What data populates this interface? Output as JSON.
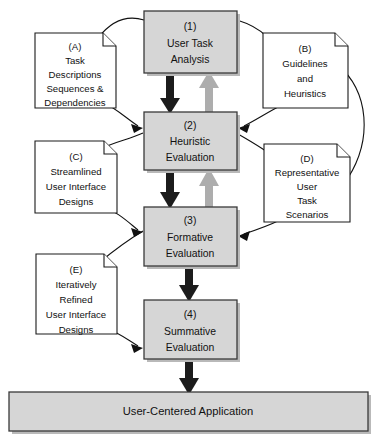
{
  "diagram": {
    "canvas": {
      "width": 379,
      "height": 444,
      "background": "#ffffff"
    },
    "colors": {
      "process_fill": "#d6d6d6",
      "process_stroke": "#3a3a3a",
      "note_fill": "#ffffff",
      "note_stroke": "#1a1a1a",
      "flow_dark": "#1c1c1c",
      "flow_gray": "#adadad",
      "connector": "#111111",
      "shadow": "#b9b9b9"
    },
    "processes": [
      {
        "id": "p1",
        "tag": "(1)",
        "lines": [
          "User Task",
          "Analysis"
        ],
        "x": 144,
        "y": 11,
        "w": 93,
        "h": 62
      },
      {
        "id": "p2",
        "tag": "(2)",
        "lines": [
          "Heuristic",
          "Evaluation"
        ],
        "x": 144,
        "y": 112,
        "w": 93,
        "h": 58
      },
      {
        "id": "p3",
        "tag": "(3)",
        "lines": [
          "Formative",
          "Evaluation"
        ],
        "x": 144,
        "y": 207,
        "w": 93,
        "h": 59
      },
      {
        "id": "p4",
        "tag": "(4)",
        "lines": [
          "Summative",
          "Evaluation"
        ],
        "x": 144,
        "y": 300,
        "w": 93,
        "h": 59
      }
    ],
    "notes": [
      {
        "id": "nA",
        "tag": "(A)",
        "lines": [
          "Task",
          "Descriptions",
          "Sequences &",
          "Dependencies"
        ],
        "x": 35,
        "y": 33,
        "w": 81,
        "h": 75,
        "fold": "top-right",
        "fold_size": 13
      },
      {
        "id": "nB",
        "tag": "(B)",
        "lines": [
          "Guidelines",
          "and",
          "Heuristics"
        ],
        "x": 263,
        "y": 33,
        "w": 85,
        "h": 75,
        "fold": "top-right",
        "fold_size": 13
      },
      {
        "id": "nC",
        "tag": "(C)",
        "lines": [
          "Streamlined",
          "User Interface",
          "Designs"
        ],
        "x": 35,
        "y": 141,
        "w": 82,
        "h": 72,
        "fold": "top-right",
        "fold_size": 13
      },
      {
        "id": "nD",
        "tag": "(D)",
        "lines": [
          "Representative",
          "User",
          "Task",
          "Scenarios"
        ],
        "x": 264,
        "y": 144,
        "w": 86,
        "h": 78,
        "fold": "top-right",
        "fold_size": 13
      },
      {
        "id": "nE",
        "tag": "(E)",
        "lines": [
          "Iteratively",
          "Refined",
          "User Interface",
          "Designs"
        ],
        "x": 36,
        "y": 254,
        "w": 81,
        "h": 80,
        "fold": "top-right",
        "fold_size": 13
      }
    ],
    "outcome_bar": {
      "id": "outcome",
      "label": "User-Centered Application",
      "x": 9,
      "y": 392,
      "w": 359,
      "h": 39
    },
    "flows": [
      {
        "id": "f-p1-p2-down",
        "from": "p1",
        "to": "p2",
        "direction": "down",
        "color": "dark",
        "x": 170,
        "y1": 73,
        "y2": 112
      },
      {
        "id": "f-p2-p1-up",
        "from": "p2",
        "to": "p1",
        "direction": "up",
        "color": "gray",
        "x": 209,
        "y1": 112,
        "y2": 73
      },
      {
        "id": "f-p2-p3-down",
        "from": "p2",
        "to": "p3",
        "direction": "down",
        "color": "dark",
        "x": 170,
        "y1": 170,
        "y2": 207
      },
      {
        "id": "f-p3-p2-up",
        "from": "p3",
        "to": "p2",
        "direction": "up",
        "color": "gray",
        "x": 209,
        "y1": 207,
        "y2": 170
      },
      {
        "id": "f-p3-p4-down",
        "from": "p3",
        "to": "p4",
        "direction": "down",
        "color": "dark",
        "x": 189,
        "y1": 266,
        "y2": 300
      },
      {
        "id": "f-p4-out-down",
        "from": "p4",
        "to": "outcome",
        "direction": "down",
        "color": "dark",
        "x": 189,
        "y1": 359,
        "y2": 394
      }
    ],
    "connectors": [
      {
        "id": "c-p1-nA",
        "from": "p1",
        "to": "nA",
        "label": "user task analysis produces task descriptions"
      },
      {
        "id": "c-p1-nB",
        "from": "p1",
        "to": "nB",
        "label": "guidelines and heuristics path"
      },
      {
        "id": "c-nA-p2",
        "from": "nA",
        "to": "p2",
        "label": "task descriptions feed heuristic evaluation"
      },
      {
        "id": "c-nB-p2",
        "from": "nB",
        "to": "p2",
        "label": "guidelines feed heuristic evaluation"
      },
      {
        "id": "c-p2-nC",
        "from": "p2",
        "to": "nC",
        "label": "heuristic evaluation produces streamlined designs"
      },
      {
        "id": "c-p2-nD",
        "from": "p2",
        "to": "nD",
        "label": "heuristic evaluation produces task scenarios"
      },
      {
        "id": "c-nB-nD",
        "from": "nB",
        "to": "nD",
        "label": "guidelines inform representative scenarios"
      },
      {
        "id": "c-nC-p3",
        "from": "nC",
        "to": "p3",
        "label": "streamlined designs feed formative evaluation"
      },
      {
        "id": "c-nD-p3",
        "from": "nD",
        "to": "p3",
        "label": "scenarios feed formative evaluation"
      },
      {
        "id": "c-p3-nE",
        "from": "p3",
        "to": "nE",
        "label": "formative evaluation produces refined designs"
      },
      {
        "id": "c-nE-p4",
        "from": "nE",
        "to": "p4",
        "label": "refined designs feed summative evaluation"
      }
    ]
  }
}
